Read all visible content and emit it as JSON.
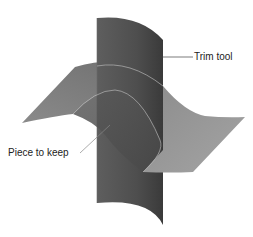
{
  "diagram": {
    "type": "3d-surface-trim-illustration",
    "labels": {
      "trim_tool": "Trim tool",
      "piece_to_keep": "Piece to keep"
    },
    "colors": {
      "background": "#ffffff",
      "trim_tool_dark": "#4a4a4a",
      "trim_tool_mid": "#5c5c5c",
      "surface_light": "#9a9a9a",
      "surface_mid": "#7a7a7a",
      "surface_dark": "#555555",
      "edge_highlight": "#b8b8b8",
      "leader_line": "#444444"
    }
  }
}
